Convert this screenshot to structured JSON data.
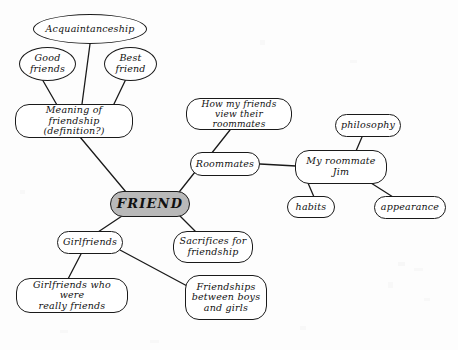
{
  "diagram": {
    "title": "FRIEND",
    "type": "concept-map",
    "style": "hand-drawn scanned mind map, cursive script lettering",
    "canvas": {
      "width": 458,
      "height": 350
    },
    "colors": {
      "background": "#fdfdfd",
      "stroke": "#1a1a1a",
      "node_fill": "#ffffff",
      "central_node_fill": "#b9b9b9",
      "text": "#111111"
    },
    "nodes": [
      {
        "id": "acquaintanceship",
        "label": "Acquaintanceship",
        "shape": "ellipse",
        "x": 33,
        "y": 14,
        "w": 114,
        "h": 30,
        "font_size": 9.5
      },
      {
        "id": "good_friends",
        "label": "Good\nfriends",
        "shape": "ellipse",
        "x": 19,
        "y": 47,
        "w": 57,
        "h": 34,
        "font_size": 9.5
      },
      {
        "id": "best_friend",
        "label": "Best\nfriend",
        "shape": "ellipse",
        "x": 104,
        "y": 47,
        "w": 53,
        "h": 34,
        "font_size": 9.5
      },
      {
        "id": "meaning_of_friendship",
        "label": "Meaning of friendship\n(definition?)",
        "shape": "rrect",
        "x": 15,
        "y": 104,
        "w": 118,
        "h": 34,
        "font_size": 9.5
      },
      {
        "id": "friend",
        "label": "FRIEND",
        "shape": "rrect",
        "central": true,
        "x": 110,
        "y": 191,
        "w": 80,
        "h": 26,
        "font_size": 13
      },
      {
        "id": "how_my_friends_view",
        "label": "How my friends\nview their roommates",
        "shape": "rrect",
        "x": 186,
        "y": 98,
        "w": 106,
        "h": 32,
        "font_size": 9
      },
      {
        "id": "roommates",
        "label": "Roommates",
        "shape": "pill",
        "x": 190,
        "y": 152,
        "w": 70,
        "h": 24,
        "font_size": 9.5
      },
      {
        "id": "my_roommate_jim",
        "label": "My roommate\nJim",
        "shape": "rrect",
        "x": 295,
        "y": 150,
        "w": 92,
        "h": 34,
        "font_size": 9.5
      },
      {
        "id": "philosophy",
        "label": "philosophy",
        "shape": "pill",
        "x": 335,
        "y": 114,
        "w": 66,
        "h": 23,
        "font_size": 9.5
      },
      {
        "id": "habits",
        "label": "habits",
        "shape": "pill",
        "x": 287,
        "y": 196,
        "w": 48,
        "h": 22,
        "font_size": 9.5
      },
      {
        "id": "appearance",
        "label": "appearance",
        "shape": "pill",
        "x": 374,
        "y": 196,
        "w": 72,
        "h": 23,
        "font_size": 9.5
      },
      {
        "id": "girlfriends",
        "label": "Girlfriends",
        "shape": "pill",
        "x": 57,
        "y": 231,
        "w": 66,
        "h": 23,
        "font_size": 9.5
      },
      {
        "id": "girlfriends_really_friends",
        "label": "Girlfriends who were\nreally friends",
        "shape": "rrect",
        "x": 16,
        "y": 278,
        "w": 112,
        "h": 35,
        "font_size": 9.5
      },
      {
        "id": "sacrifices",
        "label": "Sacrifices for\nfriendship",
        "shape": "rrect",
        "x": 173,
        "y": 231,
        "w": 80,
        "h": 32,
        "font_size": 9.5
      },
      {
        "id": "friendships_boys_girls",
        "label": "Friendships\nbetween boys\nand girls",
        "shape": "rrect",
        "x": 185,
        "y": 275,
        "w": 82,
        "h": 45,
        "font_size": 9.5
      }
    ],
    "edges": [
      {
        "from": "acquaintanceship",
        "to": "meaning_of_friendship",
        "x1": 90,
        "y1": 44,
        "x2": 82,
        "y2": 104
      },
      {
        "from": "good_friends",
        "to": "meaning_of_friendship",
        "x1": 42,
        "y1": 79,
        "x2": 57,
        "y2": 105
      },
      {
        "from": "best_friend",
        "to": "meaning_of_friendship",
        "x1": 126,
        "y1": 79,
        "x2": 113,
        "y2": 106
      },
      {
        "from": "meaning_of_friendship",
        "to": "friend",
        "x1": 80,
        "y1": 137,
        "x2": 126,
        "y2": 192
      },
      {
        "from": "how_my_friends_view",
        "to": "roommates",
        "x1": 230,
        "y1": 130,
        "x2": 211,
        "y2": 154
      },
      {
        "from": "roommates",
        "to": "friend",
        "x1": 195,
        "y1": 172,
        "x2": 176,
        "y2": 196
      },
      {
        "from": "roommates",
        "to": "my_roommate_jim",
        "x1": 260,
        "y1": 164,
        "x2": 296,
        "y2": 166
      },
      {
        "from": "philosophy",
        "to": "my_roommate_jim",
        "x1": 362,
        "y1": 137,
        "x2": 356,
        "y2": 151
      },
      {
        "from": "my_roommate_jim",
        "to": "habits",
        "x1": 308,
        "y1": 183,
        "x2": 314,
        "y2": 197
      },
      {
        "from": "my_roommate_jim",
        "to": "appearance",
        "x1": 371,
        "y1": 183,
        "x2": 393,
        "y2": 197
      },
      {
        "from": "friend",
        "to": "girlfriends",
        "x1": 122,
        "y1": 216,
        "x2": 98,
        "y2": 232
      },
      {
        "from": "friend",
        "to": "sacrifices",
        "x1": 180,
        "y1": 216,
        "x2": 196,
        "y2": 232
      },
      {
        "from": "girlfriends",
        "to": "girlfriends_really_friends",
        "x1": 81,
        "y1": 254,
        "x2": 68,
        "y2": 279
      },
      {
        "from": "girlfriends",
        "to": "friendships_boys_girls",
        "x1": 120,
        "y1": 250,
        "x2": 189,
        "y2": 287
      }
    ]
  }
}
